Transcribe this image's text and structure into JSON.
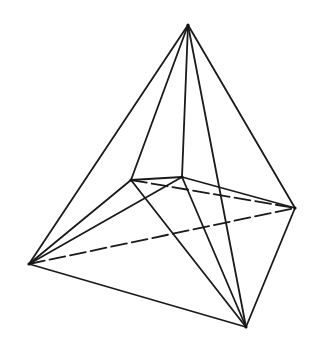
{
  "diagram": {
    "type": "wireframe-polyhedron",
    "stroke_color": "#1a1a1a",
    "background": "#ffffff",
    "vertices": {
      "apex": [
        188,
        25
      ],
      "back_left": [
        131,
        180
      ],
      "back_right": [
        182,
        177
      ],
      "right": [
        295,
        208
      ],
      "left": [
        29,
        264
      ],
      "bottom": [
        246,
        327
      ]
    },
    "edges": [
      {
        "from": "apex",
        "to": "left",
        "style": "solid"
      },
      {
        "from": "apex",
        "to": "back_left",
        "style": "solid"
      },
      {
        "from": "apex",
        "to": "back_right",
        "style": "solid"
      },
      {
        "from": "apex",
        "to": "bottom",
        "style": "solid"
      },
      {
        "from": "apex",
        "to": "right",
        "style": "solid"
      },
      {
        "from": "back_left",
        "to": "back_right",
        "style": "solid"
      },
      {
        "from": "back_left",
        "to": "right",
        "style": "dashed"
      },
      {
        "from": "back_right",
        "to": "right",
        "style": "solid"
      },
      {
        "from": "back_left",
        "to": "bottom",
        "style": "solid"
      },
      {
        "from": "back_right",
        "to": "bottom",
        "style": "solid"
      },
      {
        "from": "left",
        "to": "back_left",
        "style": "solid"
      },
      {
        "from": "left",
        "to": "back_right",
        "style": "solid"
      },
      {
        "from": "left",
        "to": "right",
        "style": "dashed"
      },
      {
        "from": "left",
        "to": "bottom",
        "style": "solid"
      },
      {
        "from": "right",
        "to": "bottom",
        "style": "solid"
      }
    ]
  }
}
